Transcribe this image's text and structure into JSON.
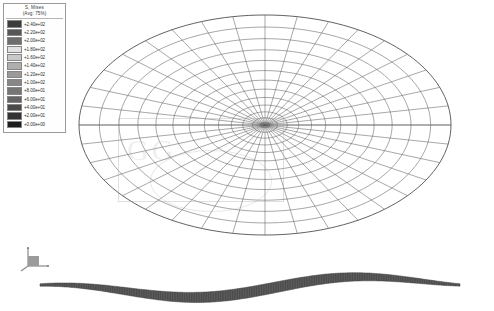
{
  "legend": {
    "title": "S, Mises",
    "avg_label": "(Avg: 75%)",
    "levels": [
      {
        "value": "+2.40e+02",
        "color": "#3c3c3c"
      },
      {
        "value": "+2.20e+02",
        "color": "#565656"
      },
      {
        "value": "+2.00e+02",
        "color": "#6e6e6e"
      },
      {
        "value": "+1.80e+02",
        "color": "#e2e2e2"
      },
      {
        "value": "+1.60e+02",
        "color": "#c9c9c9"
      },
      {
        "value": "+1.40e+02",
        "color": "#aeaeae"
      },
      {
        "value": "+1.20e+02",
        "color": "#9a9a9a"
      },
      {
        "value": "+1.00e+02",
        "color": "#878787"
      },
      {
        "value": "+8.00e+01",
        "color": "#767676"
      },
      {
        "value": "+6.00e+01",
        "color": "#646464"
      },
      {
        "value": "+4.00e+01",
        "color": "#4a4a4a"
      },
      {
        "value": "+2.00e+01",
        "color": "#333333"
      },
      {
        "value": "+0.00e+00",
        "color": "#1d1d1d"
      }
    ]
  },
  "triad": {
    "x_label": "1",
    "y_label": "2",
    "z_label": "3"
  },
  "watermark": {
    "text": "GG"
  },
  "chart_data": {
    "type": "heatmap",
    "title": "S, Mises",
    "subtitle": "(Avg: 75%)",
    "xlabel": "",
    "ylabel": "",
    "legend_position": "top-left",
    "grid": false,
    "contour_levels": [
      0,
      20,
      40,
      60,
      80,
      100,
      120,
      140,
      160,
      180,
      200,
      220,
      240
    ],
    "colorbar_min": "+0.00e+00",
    "colorbar_max": "+2.40e+02",
    "views": [
      {
        "name": "plan-view-mesh",
        "description": "circular radial-circumferential finite element mesh shown in perspective as an ellipse",
        "center_x": 265,
        "center_y": 125,
        "radius_x": 186,
        "radius_y": 110,
        "radial_divisions": 13,
        "circumferential_divisions": 36
      },
      {
        "name": "edge-view-deformed",
        "description": "edge-on view of deformed disc showing saddle wave profile",
        "center_y": 285,
        "span_x": [
          40,
          460
        ],
        "amplitude": 14
      }
    ]
  }
}
